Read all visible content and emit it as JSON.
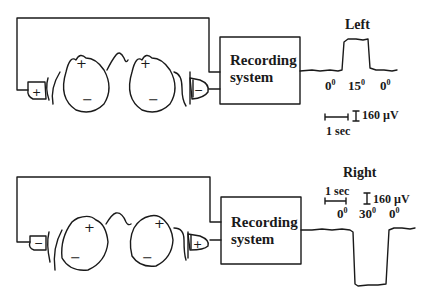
{
  "top_panel": {
    "box_label_line1": "Recording",
    "box_label_line2": "system",
    "title": "Left",
    "angle_labels": [
      "0",
      "15",
      "0"
    ],
    "angle_unit": "0",
    "time_scale": "1 sec",
    "voltage_scale": "160 µV",
    "left_electrode_sign": "+",
    "right_electrode_sign": "−",
    "eye_signs": {
      "cornea": "+",
      "retina": "−"
    }
  },
  "bottom_panel": {
    "box_label_line1": "Recording",
    "box_label_line2": "system",
    "title": "Right",
    "angle_labels": [
      "0",
      "30",
      "0"
    ],
    "angle_unit": "0",
    "time_scale": "1 sec",
    "voltage_scale": "160 µV",
    "left_electrode_sign": "−",
    "right_electrode_sign": "+",
    "eye_signs": {
      "cornea": "+",
      "retina": "−"
    }
  },
  "colors": {
    "ink": "#1a1a1a",
    "background": "#ffffff"
  }
}
